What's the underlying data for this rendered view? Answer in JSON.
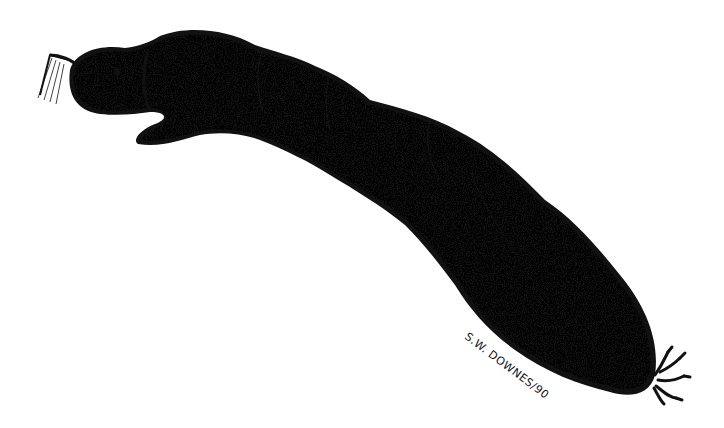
{
  "illustration": {
    "subject": "larva",
    "style": "stipple ink drawing",
    "ink_color": "#111111",
    "background_color": "#ffffff"
  },
  "signature": {
    "text": "S.W. DOWNES/90"
  }
}
